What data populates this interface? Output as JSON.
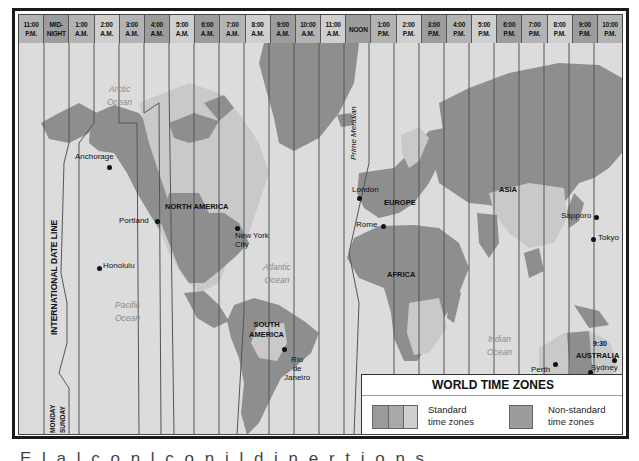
{
  "header": {
    "zones": [
      {
        "time": "11:00",
        "period": "P.M.",
        "shade": "mid"
      },
      {
        "time": "MID-",
        "period": "NIGHT",
        "shade": "dark"
      },
      {
        "time": "1:00",
        "period": "A.M.",
        "shade": "mid"
      },
      {
        "time": "2:00",
        "period": "A.M.",
        "shade": "light"
      },
      {
        "time": "3:00",
        "period": "A.M.",
        "shade": "mid"
      },
      {
        "time": "4:00",
        "period": "A.M.",
        "shade": "dark"
      },
      {
        "time": "5:00",
        "period": "A.M.",
        "shade": "light"
      },
      {
        "time": "6:00",
        "period": "A.M.",
        "shade": "dark"
      },
      {
        "time": "7:00",
        "period": "A.M.",
        "shade": "mid"
      },
      {
        "time": "8:00",
        "period": "A.M.",
        "shade": "light"
      },
      {
        "time": "9:00",
        "period": "A.M.",
        "shade": "dark"
      },
      {
        "time": "10:00",
        "period": "A.M.",
        "shade": "mid"
      },
      {
        "time": "11:00",
        "period": "A.M.",
        "shade": "light"
      },
      {
        "time": "NOON",
        "period": "",
        "shade": "dark"
      },
      {
        "time": "1:00",
        "period": "P.M.",
        "shade": "mid"
      },
      {
        "time": "2:00",
        "period": "P.M.",
        "shade": "light"
      },
      {
        "time": "3:00",
        "period": "P.M.",
        "shade": "dark"
      },
      {
        "time": "4:00",
        "period": "P.M.",
        "shade": "mid"
      },
      {
        "time": "5:00",
        "period": "P.M.",
        "shade": "light"
      },
      {
        "time": "6:00",
        "period": "P.M.",
        "shade": "dark"
      },
      {
        "time": "7:00",
        "period": "P.M.",
        "shade": "mid"
      },
      {
        "time": "8:00",
        "period": "P.M.",
        "shade": "light"
      },
      {
        "time": "9:00",
        "period": "P.M.",
        "shade": "dark"
      },
      {
        "time": "10:00",
        "period": "P.M.",
        "shade": "mid"
      }
    ]
  },
  "map": {
    "oceans": {
      "arctic": "Arctic\nOcean",
      "pacific": "Pacific\nOcean",
      "atlantic": "Atlantic\nOcean",
      "indian": "Indian\nOcean"
    },
    "continents": {
      "north_america": "NORTH AMERICA",
      "south_america": "SOUTH\nAMERICA",
      "europe": "EUROPE",
      "africa": "AFRICA",
      "asia": "ASIA",
      "australia": "AUSTRALIA"
    },
    "cities": {
      "anchorage": "Anchorage",
      "portland": "Portland",
      "honolulu": "Honolulu",
      "new_york": "New York\nCity",
      "rio": "Rio\nde\nJaneiro",
      "london": "London",
      "rome": "Rome",
      "sapporo": "Sapporo",
      "tokyo": "Tokyo",
      "perth": "Perth",
      "adelaide": "Adelaide",
      "sydney": "Sydney"
    },
    "annotations": {
      "date_line": "INTERNATIONAL DATE LINE",
      "prime_meridian": "Prime Meridian",
      "monday": "MONDAY",
      "sunday": "SUNDAY",
      "australia_offset": "9:30"
    }
  },
  "legend": {
    "title": "WORLD TIME ZONES",
    "standard_label": "Standard\ntime zones",
    "nonstandard_label": "Non-standard\ntime zones"
  },
  "colors": {
    "land_dark": "#8e8e8e",
    "land_light": "#c9c9c9",
    "sea": "#dcdcdc",
    "zone_line": "#555555"
  },
  "caption": {
    "partial_text": "E  l  a  l  c  o  n  l  c  o  n  i  l  d  i  n  e  r  t  i  o  n  s"
  }
}
